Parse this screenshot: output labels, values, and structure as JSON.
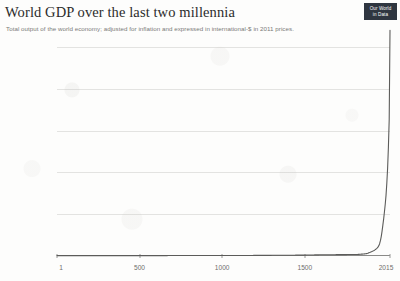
{
  "header": {
    "title": "World GDP over the last two millennia",
    "subtitle": "Total output of the world economy; adjusted for inflation and expressed in international-$ in 2011 prices.",
    "logo": {
      "line1": "Our World",
      "line2": "in Data"
    }
  },
  "colors": {
    "line": "#5c5c5a",
    "gridline": "#e3e3e1",
    "axis": "#8a8a88",
    "tick_text": "#6f6f6d",
    "title_text": "#2b2b2b",
    "subtitle_text": "#7a7a78",
    "logo_background": "#2f3640",
    "background": "#fdfdfc"
  },
  "chart_data": {
    "type": "line",
    "title": "World GDP over the last two millennia",
    "subtitle": "Total output of the world economy; adjusted for inflation and expressed in international-$ in 2011 prices.",
    "xlabel": "",
    "ylabel": "",
    "xlim": [
      1,
      2015
    ],
    "ylim": [
      0,
      100
    ],
    "y_unit": "trillion international-$ (2011 prices)",
    "grid": true,
    "legend": false,
    "y_ticks": [
      0,
      20,
      40,
      60,
      80,
      100
    ],
    "y_tick_labels": [
      "$0",
      "$20 trillion",
      "$40 trillion",
      "$60 trillion",
      "$80 trillion",
      "$100 trillion"
    ],
    "x_ticks": [
      1,
      500,
      1000,
      1500,
      2015
    ],
    "x_tick_labels": [
      "1",
      "500",
      "1000",
      "1500",
      "2015"
    ],
    "series": [
      {
        "name": "World GDP",
        "x": [
          1,
          500,
          1000,
          1500,
          1600,
          1700,
          1820,
          1870,
          1900,
          1920,
          1940,
          1950,
          1960,
          1970,
          1980,
          1990,
          2000,
          2010,
          2015
        ],
        "values": [
          0.18,
          0.2,
          0.21,
          0.43,
          0.59,
          0.64,
          0.74,
          1.1,
          1.97,
          2.7,
          4.0,
          5.3,
          8.4,
          13.8,
          20.2,
          28.0,
          41.0,
          64.0,
          108.0
        ]
      }
    ]
  }
}
